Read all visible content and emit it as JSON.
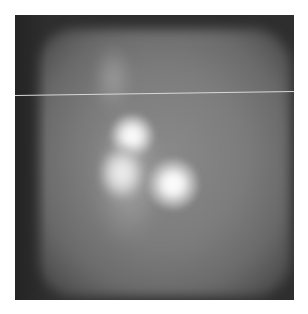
{
  "image": {
    "type": "grayscale scintigraphy-style scan",
    "frame": {
      "x": 15,
      "y": 15,
      "width": 279,
      "height": 285
    },
    "hotspots": [
      {
        "label": "upper-central-hotspot",
        "x": 131,
        "y": 135
      },
      {
        "label": "mid-left-hotspot",
        "x": 120,
        "y": 170
      },
      {
        "label": "lower-right-hotspot",
        "x": 172,
        "y": 183
      },
      {
        "label": "faint-upper-blob",
        "x": 110,
        "y": 72
      }
    ],
    "scanline": {
      "x1": 15,
      "y1": 97,
      "x2": 293,
      "y2": 93,
      "color": "#d8d8d8"
    }
  }
}
